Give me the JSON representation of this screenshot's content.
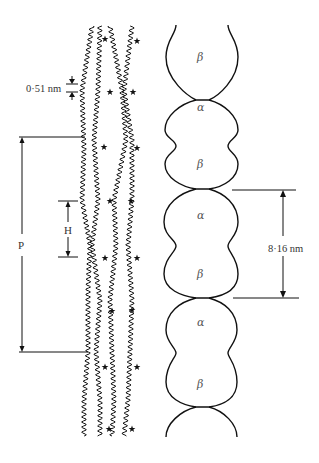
{
  "diagram": {
    "type": "schematic of tubulin / protofilament structure",
    "left_panel": {
      "description": "wavy helical chains with starred sites",
      "chains": 4,
      "labels": {
        "pitch_spacing": "0·51 nm",
        "helix_period": "P",
        "half_period": "H"
      },
      "star_marker": "★"
    },
    "right_panel": {
      "description": "chain of alpha/beta bilobed subunits",
      "subunits": [
        "β",
        "α",
        "β",
        "α",
        "β",
        "α",
        "β"
      ],
      "dimer_length_label": "8·16 nm"
    }
  }
}
